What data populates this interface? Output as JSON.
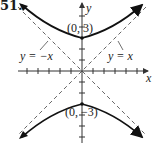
{
  "problem_number": "51.",
  "axes": {
    "x_label": "x",
    "y_label": "y"
  },
  "curve": {
    "name": "hyperbola",
    "vertices": [
      {
        "label": "(0, 3)",
        "x": 0,
        "y": 3
      },
      {
        "label": "(0, −3)",
        "x": 0,
        "y": -3
      }
    ]
  },
  "asymptotes": [
    {
      "label": "y = −x",
      "slope": -1
    },
    {
      "label": "y = x",
      "slope": 1
    }
  ],
  "colors": {
    "curve": "#111111",
    "axes": "#333333",
    "asymptote": "#555555"
  }
}
